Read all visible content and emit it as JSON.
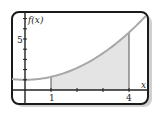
{
  "chart_data": {
    "type": "area",
    "title": "",
    "xlabel": "x",
    "ylabel": "f(x)",
    "function_description": "increasing concave-up curve, approx f(x) = 1 + 0.29x^2",
    "x": [
      -1,
      0,
      1,
      2,
      3,
      4,
      4.6
    ],
    "values": [
      1.29,
      1.0,
      1.29,
      2.16,
      3.61,
      5.64,
      7.1
    ],
    "shaded_region": {
      "from": 1,
      "to": 4,
      "color": "#e4e4e4"
    },
    "x_tick_labels": [
      {
        "value": 1,
        "label": "1"
      },
      {
        "value": 4,
        "label": "4"
      }
    ],
    "x_ticks": [
      1,
      2,
      3,
      4
    ],
    "y_tick_labels": [
      {
        "value": 5,
        "label": "5"
      }
    ],
    "y_ticks": [
      1,
      2,
      3,
      4,
      5,
      6,
      7
    ],
    "xlim": [
      -0.5,
      4.7
    ],
    "ylim": [
      -1.4,
      7.6
    ],
    "grid": false,
    "legend": null,
    "colors": {
      "curve": "#a8a8a8",
      "shade": "#e4e4e4",
      "axis": "#222222",
      "frame": "#1a1a1a",
      "shadow": "#c8c8c8"
    }
  },
  "labels": {
    "y_axis": "f(x)",
    "x_axis": "x",
    "tick_1": "1",
    "tick_4": "4",
    "tick_5": "5"
  }
}
